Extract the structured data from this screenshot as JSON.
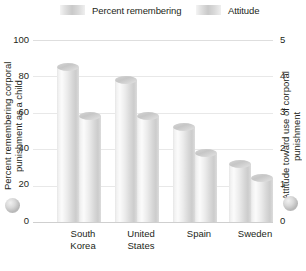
{
  "chart_data": {
    "type": "bar",
    "title": "",
    "subtitle": "",
    "categories": [
      "South Korea",
      "United States",
      "Spain",
      "Sweden"
    ],
    "series": [
      {
        "name": "Percent remembering",
        "axis": "left",
        "values": [
          85,
          78,
          52,
          32
        ]
      },
      {
        "name": "Attitude",
        "axis": "right",
        "values": [
          2.9,
          2.9,
          1.9,
          1.2
        ]
      }
    ],
    "xlabel": "",
    "ylabel": "Percent remembering corporal punishment as a child",
    "y2label": "Attitude toward use of corporal punishment",
    "ylim": [
      0,
      100
    ],
    "y2lim": [
      0,
      5
    ],
    "yticks": [
      0,
      20,
      40,
      60,
      80,
      100
    ],
    "y2ticks": [
      0,
      1,
      2,
      3,
      4,
      5
    ],
    "grid": true,
    "legend_position": "top"
  },
  "legend": {
    "items": [
      {
        "label": "Percent remembering",
        "swatch": "gradient-gray"
      },
      {
        "label": "Attitude",
        "swatch": "gradient-gray"
      }
    ]
  },
  "axes": {
    "left": {
      "title": "Percent remembering corporal punishment as a child",
      "ticks": [
        "100",
        "80",
        "60",
        "40",
        "20",
        "0"
      ]
    },
    "right": {
      "title": "Attitude toward use of corporal punishment",
      "ticks": [
        "5",
        "4",
        "3",
        "2",
        "1",
        "0"
      ]
    }
  },
  "categories": [
    {
      "line1": "South",
      "line2": "Korea"
    },
    {
      "line1": "United",
      "line2": "States"
    },
    {
      "line1": "Spain",
      "line2": ""
    },
    {
      "line1": "Sweden",
      "line2": ""
    }
  ],
  "markers": {
    "left_sphere": "sphere-marker",
    "right_sphere": "sphere-marker"
  }
}
